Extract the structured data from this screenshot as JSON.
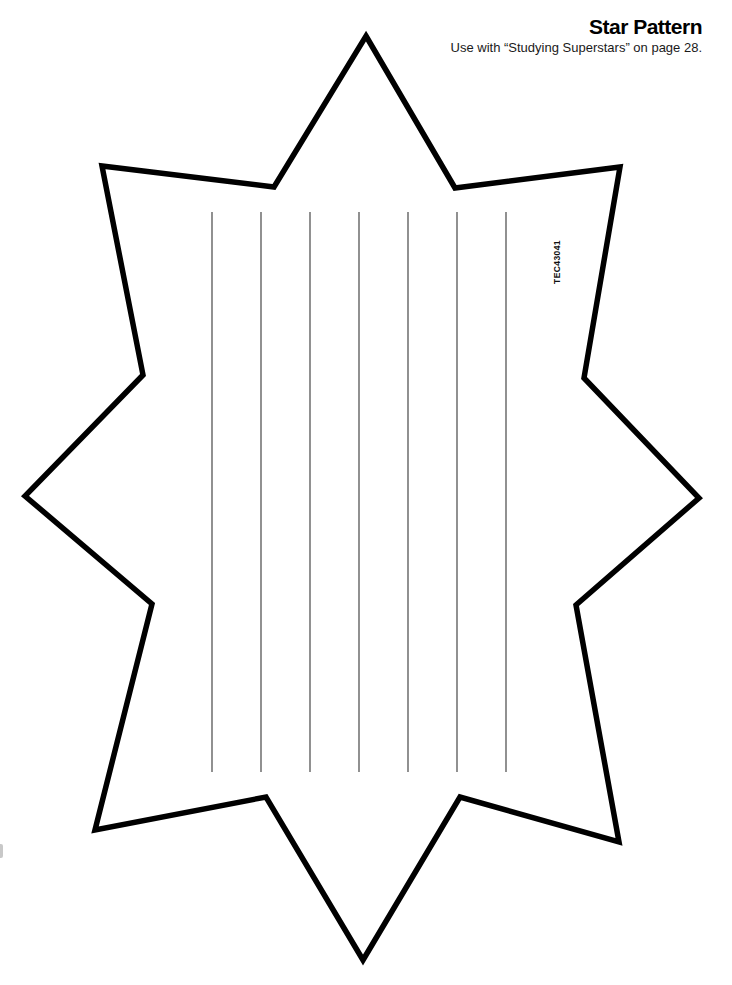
{
  "page": {
    "title": "Star Pattern",
    "subtitle": "Use with “Studying Superstars” on page 28.",
    "product_code": "TEC43041",
    "background_color": "#ffffff",
    "ink_color": "#000000"
  },
  "pattern": {
    "description": "8-pointed star outline with vertical writing lines",
    "outline_points": [
      [
        366,
        36
      ],
      [
        455,
        188
      ],
      [
        620,
        167
      ],
      [
        584,
        378
      ],
      [
        699,
        498
      ],
      [
        576,
        605
      ],
      [
        619,
        842
      ],
      [
        460,
        797
      ],
      [
        363,
        960
      ],
      [
        266,
        797
      ],
      [
        95,
        830
      ],
      [
        152,
        604
      ],
      [
        25,
        496
      ],
      [
        143,
        375
      ],
      [
        102,
        166
      ],
      [
        274,
        187
      ]
    ],
    "outline_stroke_width": 5.5,
    "writing_lines": {
      "count": 7,
      "x_start": 212,
      "x_spacing": 49,
      "y_top": 212,
      "y_bottom": 772,
      "color": "#555555",
      "width": 1.3
    }
  }
}
